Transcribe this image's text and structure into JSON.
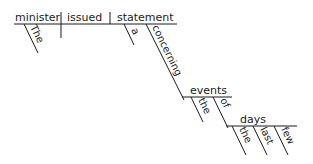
{
  "diagram": {
    "type": "sentence-diagram",
    "subject": "minister",
    "verb": "issued",
    "object": "statement",
    "modifiers": {
      "minister": [
        "The"
      ],
      "statement": [
        "a",
        "concerning"
      ],
      "concerning_object": "events",
      "events": [
        "the",
        "of"
      ],
      "of_object": "days",
      "days": [
        "the",
        "last",
        "few"
      ]
    }
  }
}
